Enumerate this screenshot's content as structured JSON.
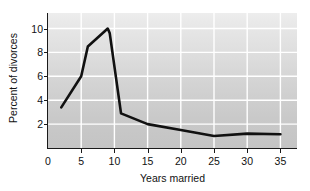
{
  "chart_data": {
    "type": "line",
    "title": "",
    "xlabel": "Years married",
    "ylabel": "Percent of divorces",
    "xlim": [
      0,
      37.5
    ],
    "ylim": [
      0,
      11.3
    ],
    "grid": true,
    "legend": null,
    "x_ticks": [
      0,
      5,
      10,
      15,
      20,
      25,
      30,
      35
    ],
    "x_tick_labels": [
      "0",
      "5",
      "10",
      "15",
      "20",
      "25",
      "30",
      "35"
    ],
    "y_ticks": [
      2,
      4,
      6,
      8,
      10
    ],
    "y_tick_labels": [
      "2",
      "4",
      "6",
      "8",
      "10"
    ],
    "line_color": "#111111",
    "plot_background": "#d8d8d8",
    "gridline_color": "#ffffff",
    "series": [
      {
        "name": "Percent of divorces",
        "x": [
          2,
          5,
          6,
          9,
          9.3,
          11,
          15,
          20,
          25,
          30,
          35
        ],
        "y": [
          3.4,
          6.0,
          8.5,
          10.0,
          9.6,
          2.9,
          2.0,
          1.5,
          1.0,
          1.2,
          1.15
        ]
      }
    ]
  },
  "axes": {
    "y_title": "Percent of divorces",
    "x_title": "Years married"
  }
}
